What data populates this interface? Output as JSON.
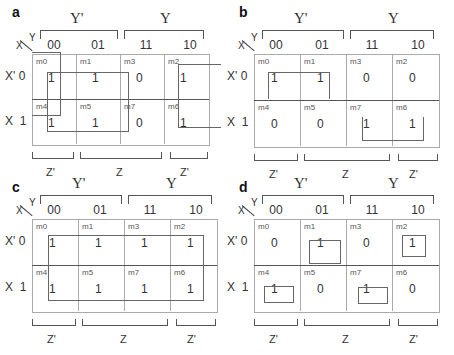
{
  "panels": [
    {
      "id": "a",
      "label": "a",
      "row_var": "X",
      "col_var": "Y",
      "col_group_labels": [
        "Y'",
        "Y"
      ],
      "col_heads": [
        "00",
        "01",
        "11",
        "10"
      ],
      "row_heads": [
        "X' 0",
        "X  1"
      ],
      "bottom_labels": [
        "Z'",
        "Z",
        "Z'"
      ],
      "cells": [
        [
          {
            "m": "m0",
            "v": "1"
          },
          {
            "m": "m1",
            "v": "1"
          },
          {
            "m": "m3",
            "v": "0"
          },
          {
            "m": "m2",
            "v": "1"
          }
        ],
        [
          {
            "m": "m4",
            "v": "1"
          },
          {
            "m": "m5",
            "v": "1"
          },
          {
            "m": "m7",
            "v": "0"
          },
          {
            "m": "m6",
            "v": "1"
          }
        ]
      ],
      "groups": [
        "m0-m1-m4-m5 box",
        "m0-m4 column",
        "m2-m6 wrap-around"
      ]
    },
    {
      "id": "b",
      "label": "b",
      "row_var": "X",
      "col_var": "Y",
      "col_group_labels": [
        "Y'",
        "Y"
      ],
      "col_heads": [
        "00",
        "01",
        "11",
        "10"
      ],
      "row_heads": [
        "X' 0",
        "X  1"
      ],
      "bottom_labels": [
        "Z'",
        "Z",
        "Z'"
      ],
      "cells": [
        [
          {
            "m": "m0",
            "v": "1"
          },
          {
            "m": "m1",
            "v": "1"
          },
          {
            "m": "m3",
            "v": "0"
          },
          {
            "m": "m2",
            "v": "0"
          }
        ],
        [
          {
            "m": "m4",
            "v": "0"
          },
          {
            "m": "m5",
            "v": "0"
          },
          {
            "m": "m7",
            "v": "1"
          },
          {
            "m": "m6",
            "v": "1"
          }
        ]
      ],
      "groups": [
        "m0-m1",
        "m7-m6"
      ]
    },
    {
      "id": "c",
      "label": "c",
      "row_var": "X",
      "col_var": "Y",
      "col_group_labels": [
        "Y'",
        "Y"
      ],
      "col_heads": [
        "00",
        "01",
        "11",
        "10"
      ],
      "row_heads": [
        "X' 0",
        "X  1"
      ],
      "bottom_labels": [
        "Z'",
        "Z",
        "Z'"
      ],
      "cells": [
        [
          {
            "m": "m0",
            "v": "1"
          },
          {
            "m": "m1",
            "v": "1"
          },
          {
            "m": "m3",
            "v": "1"
          },
          {
            "m": "m2",
            "v": "1"
          }
        ],
        [
          {
            "m": "m4",
            "v": "1"
          },
          {
            "m": "m5",
            "v": "1"
          },
          {
            "m": "m7",
            "v": "1"
          },
          {
            "m": "m6",
            "v": "1"
          }
        ]
      ],
      "groups": [
        "all eight cells"
      ]
    },
    {
      "id": "d",
      "label": "d",
      "row_var": "X",
      "col_var": "Y",
      "col_group_labels": [
        "Y'",
        "Y"
      ],
      "col_heads": [
        "00",
        "01",
        "11",
        "10"
      ],
      "row_heads": [
        "X' 0",
        "X  1"
      ],
      "bottom_labels": [
        "Z'",
        "Z",
        "Z'"
      ],
      "cells": [
        [
          {
            "m": "m0",
            "v": "0"
          },
          {
            "m": "m1",
            "v": "1"
          },
          {
            "m": "m3",
            "v": "0"
          },
          {
            "m": "m2",
            "v": "1"
          }
        ],
        [
          {
            "m": "m4",
            "v": "1"
          },
          {
            "m": "m5",
            "v": "0"
          },
          {
            "m": "m7",
            "v": "1"
          },
          {
            "m": "m6",
            "v": "0"
          }
        ]
      ],
      "groups": [
        "m1",
        "m2",
        "m4",
        "m7"
      ]
    }
  ]
}
